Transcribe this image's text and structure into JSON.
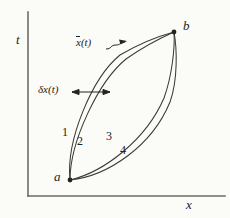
{
  "figure": {
    "background_color": "#fbfbf7",
    "ink_color": "#3a3a36",
    "text_color": "#232323",
    "axes": {
      "y_axis_label": "t",
      "x_axis_label": "x",
      "origin_px": [
        28,
        196
      ],
      "y_axis_top_px": [
        28,
        12
      ],
      "x_axis_right_px": [
        225,
        196
      ]
    },
    "points": [
      {
        "name": "a",
        "label": "a",
        "x_px": 70,
        "y_px": 180
      },
      {
        "name": "b",
        "label": "b",
        "x_px": 174,
        "y_px": 32
      }
    ],
    "annotations": {
      "xbar_label": "x(t)",
      "xbar_label_overbar_char": "x",
      "xbar_label_suffix": "(t)",
      "delta_label": "δx(t)",
      "delta_arrow_type": "double-headed-horizontal",
      "xbar_arrow_type": "single-headed-wavy"
    },
    "curve_labels": [
      {
        "id": "1",
        "label": "1"
      },
      {
        "id": "2",
        "label": "2"
      },
      {
        "id": "3",
        "label": "3"
      },
      {
        "id": "4",
        "label": "4"
      }
    ],
    "curves": [
      {
        "id": "1",
        "description": "outer left path a to b, bulges up-left",
        "path": "M 70 180 C 66 140, 92 78, 120 55 C 142 42, 163 35, 174 32"
      },
      {
        "id": "2",
        "description": "inner left path a to b, slightly right of curve 1",
        "path": "M 70 180 C 70 142, 98 82, 126 59 C 146 45, 165 36, 174 32"
      },
      {
        "id": "3",
        "description": "inner right path a to b, bulges down-right",
        "path": "M 70 180 C 104 172, 146 140, 164 98 C 172 76, 175 48, 174 32"
      },
      {
        "id": "4",
        "description": "outer right path a to b, furthest down-right",
        "path": "M 70 180 C 108 176, 152 146, 170 102 C 178 80, 177 48, 174 32"
      }
    ],
    "chart_data": {
      "type": "line",
      "title": "",
      "xlabel": "x",
      "ylabel": "t",
      "grid": false,
      "legend": "none",
      "series": [
        {
          "name": "1",
          "note": "varied path, leftmost"
        },
        {
          "name": "2",
          "note": "varied path, left inner"
        },
        {
          "name": "3",
          "note": "varied path, right inner"
        },
        {
          "name": "4",
          "note": "varied path, rightmost"
        }
      ],
      "endpoints": {
        "start": "a",
        "end": "b"
      }
    }
  }
}
